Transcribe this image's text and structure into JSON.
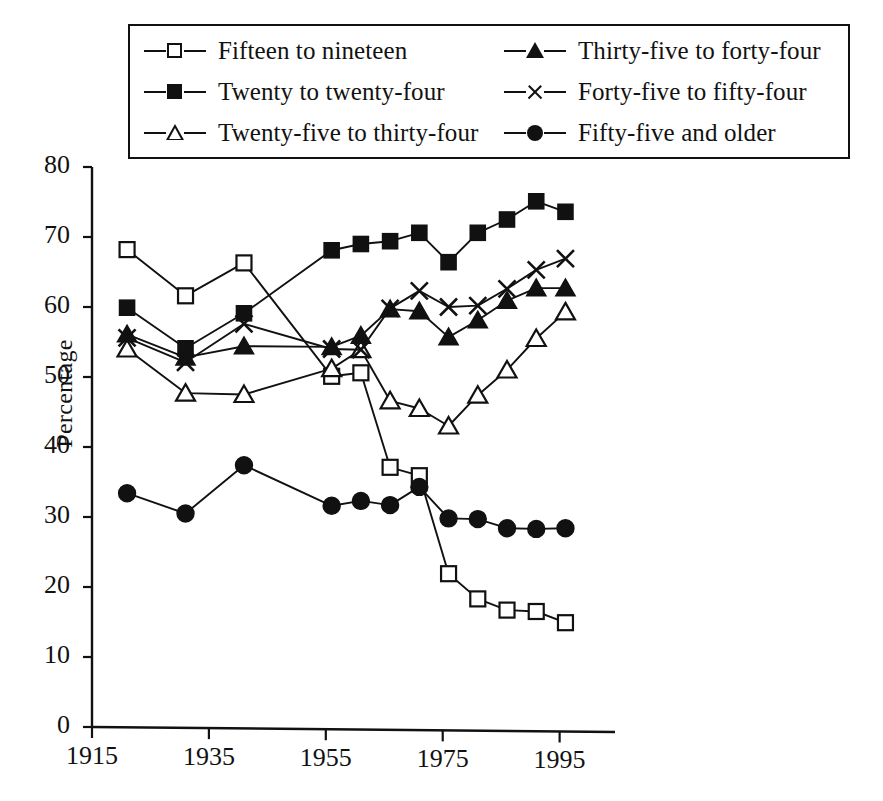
{
  "chart_data": {
    "type": "line",
    "title": "",
    "xlabel": "",
    "ylabel": "Percentage",
    "xlim": [
      1915,
      1999
    ],
    "ylim": [
      0,
      80
    ],
    "x_ticks": [
      1915,
      1935,
      1955,
      1975,
      1995
    ],
    "y_ticks": [
      0,
      10,
      20,
      30,
      40,
      50,
      60,
      70,
      80
    ],
    "grid": false,
    "legend_position": "top",
    "x": [
      1921,
      1931,
      1941,
      1956,
      1961,
      1966,
      1971,
      1976,
      1981,
      1986,
      1991,
      1996
    ],
    "series": [
      {
        "name": "Fifteen to nineteen",
        "marker": "square-open",
        "values": [
          68.2,
          61.6,
          66.3,
          50.1,
          50.6,
          37.1,
          35.9,
          21.9,
          18.3,
          16.7,
          16.5,
          14.9
        ]
      },
      {
        "name": "Twenty to twenty-four",
        "marker": "square-filled",
        "values": [
          59.9,
          54.1,
          59.1,
          68.1,
          69.0,
          69.4,
          70.6,
          66.4,
          70.6,
          72.5,
          75.1,
          73.6
        ]
      },
      {
        "name": "Twenty-five to thirty-four",
        "marker": "triangle-open",
        "values": [
          54.0,
          47.7,
          47.5,
          51.2,
          53.9,
          46.6,
          45.5,
          43.0,
          47.4,
          51.0,
          55.5,
          59.3
        ]
      },
      {
        "name": "Thirty-five to forty-four",
        "marker": "triangle-filled",
        "values": [
          56.1,
          52.8,
          54.4,
          54.3,
          55.9,
          59.7,
          59.4,
          55.7,
          58.1,
          60.9,
          62.7,
          62.7
        ]
      },
      {
        "name": "Forty-five to fifty-four",
        "marker": "cross",
        "values": [
          55.6,
          52.1,
          57.6,
          54.0,
          53.9,
          59.8,
          62.3,
          60.0,
          60.2,
          62.6,
          65.3,
          66.9
        ]
      },
      {
        "name": "Fifty-five and older",
        "marker": "circle-filled",
        "values": [
          33.4,
          30.5,
          37.4,
          31.6,
          32.3,
          31.7,
          34.3,
          29.8,
          29.7,
          28.4,
          28.3,
          28.4
        ]
      }
    ]
  },
  "legend": {
    "entries": [
      {
        "label": "Fifteen to nineteen",
        "marker": "square-open"
      },
      {
        "label": "Thirty-five to forty-four",
        "marker": "triangle-filled"
      },
      {
        "label": "Twenty to twenty-four",
        "marker": "square-filled"
      },
      {
        "label": "Forty-five to fifty-four",
        "marker": "cross"
      },
      {
        "label": "Twenty-five to thirty-four",
        "marker": "triangle-open"
      },
      {
        "label": "Fifty-five and older",
        "marker": "circle-filled"
      }
    ]
  },
  "axes": {
    "y_label": "Percentage",
    "y_tick_labels": [
      "80",
      "70",
      "60",
      "50",
      "40",
      "30",
      "20",
      "10",
      "0"
    ],
    "x_tick_labels": [
      "1915",
      "1935",
      "1955",
      "1975",
      "1995"
    ]
  },
  "colors": {
    "ink": "#111111",
    "background": "#ffffff"
  }
}
